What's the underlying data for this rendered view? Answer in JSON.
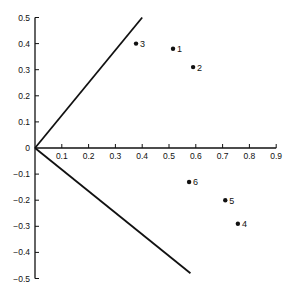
{
  "chart_data": {
    "type": "scatter",
    "title": "",
    "xlabel": "",
    "ylabel": "",
    "xlim": [
      0,
      0.9
    ],
    "ylim": [
      -0.5,
      0.5
    ],
    "grid": false,
    "legend": null,
    "x_ticks": [
      "0.1",
      "0.2",
      "0.3",
      "0.4",
      "0.5",
      "0.6",
      "0.7",
      "0.8",
      "0.9"
    ],
    "y_ticks": [
      "0.5",
      "0.4",
      "0.3",
      "0.2",
      "0.1",
      "0",
      "-0.1",
      "-0.2",
      "-0.3",
      "-0.4",
      "-0.5"
    ],
    "origin_label": "0",
    "points": [
      {
        "label": "1",
        "x": 0.515,
        "y": 0.38
      },
      {
        "label": "2",
        "x": 0.59,
        "y": 0.31
      },
      {
        "label": "3",
        "x": 0.377,
        "y": 0.4
      },
      {
        "label": "4",
        "x": 0.757,
        "y": -0.29
      },
      {
        "label": "5",
        "x": 0.71,
        "y": -0.2
      },
      {
        "label": "6",
        "x": 0.575,
        "y": -0.13
      }
    ],
    "lines": [
      {
        "name": "upper-boundary",
        "from": [
          0,
          0
        ],
        "to": [
          0.4,
          0.5
        ]
      },
      {
        "name": "lower-boundary",
        "from": [
          0,
          0
        ],
        "to": [
          0.58,
          -0.48
        ]
      }
    ]
  }
}
